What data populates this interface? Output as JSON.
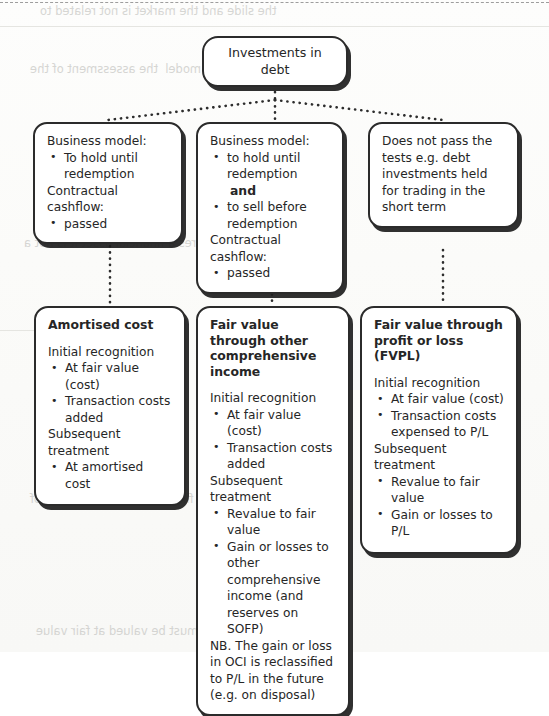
{
  "diagram": {
    "root": {
      "label": "Investments in debt"
    },
    "criteria": [
      {
        "id": "crit-1",
        "heading1": "Business model:",
        "bullets1": [
          "To hold until redemption"
        ],
        "heading2": "Contractual cashflow:",
        "bullets2": [
          "passed"
        ]
      },
      {
        "id": "crit-2",
        "heading1": "Business model:",
        "bullets1": [
          "to hold until redemption"
        ],
        "connector": "and",
        "bullets1b": [
          "to sell before redemption"
        ],
        "heading2": "Contractual cashflow:",
        "bullets2": [
          "passed"
        ]
      },
      {
        "id": "crit-3",
        "text": "Does not pass the tests e.g. debt investments held for trading in the short term"
      }
    ],
    "outcomes": [
      {
        "id": "out-1",
        "title": "Amortised cost",
        "heading1": "Initial recognition",
        "bullets1": [
          "At fair value (cost)",
          "Transaction costs added"
        ],
        "heading2": "Subsequent treatment",
        "bullets2": [
          "At amortised cost"
        ]
      },
      {
        "id": "out-2",
        "title": "Fair value through other comprehensive income",
        "heading1": "Initial recognition",
        "bullets1": [
          "At fair value (cost)",
          "Transaction costs added"
        ],
        "heading2": "Subsequent treatment",
        "bullets2": [
          "Revalue to fair value",
          "Gain or losses to other comprehensive income (and reserves on SOFP)"
        ],
        "note": "NB. The gain or loss in OCI is reclassified to P/L in the future (e.g. on disposal)"
      },
      {
        "id": "out-3",
        "title": "Fair value through profit or loss (FVPL)",
        "heading1": "Initial recognition",
        "bullets1": [
          "At fair value (cost)",
          "Transaction costs expensed to P/L"
        ],
        "heading2": "Subsequent treatment",
        "bullets2": [
          "Revalue to fair value",
          "Gain or losses to P/L"
        ]
      }
    ]
  },
  "style": {
    "ink": "#262626",
    "border": "#2b2b2b",
    "paper": "#fbfbfa",
    "connector": "#2d2d2d"
  },
  "scan_artifacts": {
    "bleed_1": "the slide and the market is not related to",
    "bleed_2": "the entity business model  the assessment of the",
    "bleed_3": "the entity acquires a financial asset it is not a",
    "bleed_4": "in the financial report  the value of",
    "bleed_5": "must be valued at fair value"
  }
}
